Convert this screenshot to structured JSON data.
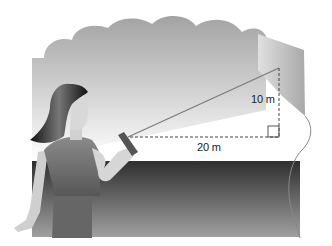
{
  "diagram": {
    "labels": {
      "vertical": "10 m",
      "horizontal": "20 m"
    },
    "right_angle_marker": true,
    "colors": {
      "sky_cloud": "#9a9a9a",
      "ground_dark": "#333333",
      "ground_light": "#9d9d9d",
      "string": "#7a7a7a",
      "dashed": "#444444"
    }
  }
}
